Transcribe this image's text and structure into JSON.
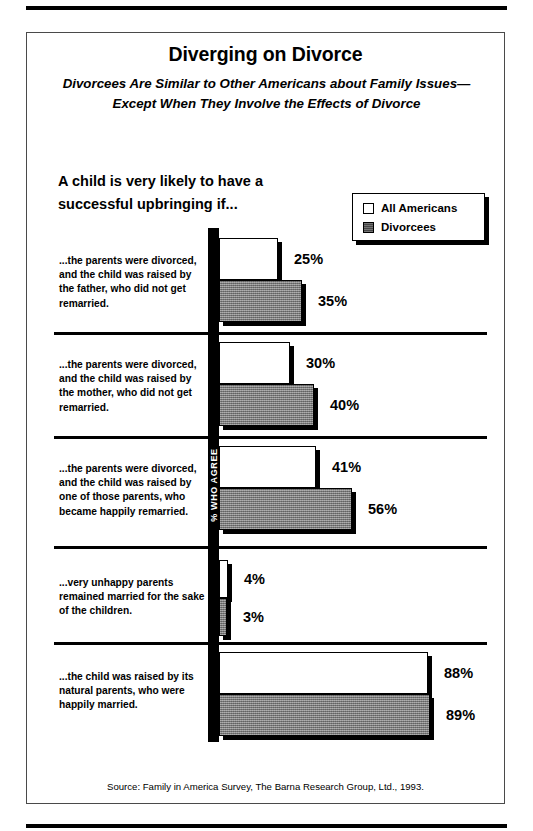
{
  "title": "Diverging on Divorce",
  "subtitle": "Divorcees Are Similar to Other Americans about Family Issues—Except When They Involve the Effects of Divorce",
  "question_header": "A child is very likely to have a successful upbringing if...",
  "axis_caption": "% WHO AGREE",
  "legend": {
    "items": [
      {
        "label": "All Americans",
        "swatch": "white-square-icon",
        "color": "#ffffff"
      },
      {
        "label": "Divorcees",
        "swatch": "gray-square-icon",
        "color": "#808080"
      }
    ]
  },
  "source": "Source: Family in America Survey, The Barna Research Group, Ltd., 1993.",
  "chart_data": {
    "type": "bar",
    "title": "Diverging on Divorce",
    "subtitle": "Divorcees Are Similar to Other Americans about Family Issues—Except When They Involve the Effects of Divorce",
    "xlabel": "% WHO AGREE",
    "ylabel": "",
    "orientation": "horizontal",
    "grid": false,
    "legend_position": "top-right",
    "xlim": [
      0,
      100
    ],
    "categories": [
      "...the parents were divorced, and the child was raised by the father, who did not get remarried.",
      "...the parents were divorced, and the child was raised by the mother, who did not get remarried.",
      "...the parents were divorced, and the child was raised by one of those parents, who became happily remarried.",
      "...very unhappy parents remained married for the sake of the children.",
      "...the child was raised by its natural parents, who were happily married."
    ],
    "series": [
      {
        "name": "All Americans",
        "color": "#ffffff",
        "values": [
          25,
          30,
          41,
          4,
          88
        ]
      },
      {
        "name": "Divorcees",
        "color": "#808080",
        "values": [
          35,
          40,
          56,
          3,
          89
        ]
      }
    ],
    "value_labels": [
      [
        "25%",
        "35%"
      ],
      [
        "30%",
        "40%"
      ],
      [
        "41%",
        "56%"
      ],
      [
        "4%",
        "3%"
      ],
      [
        "88%",
        "89%"
      ]
    ]
  },
  "rows": [
    {
      "label": "...the parents were divorced, and the child was raised by the father, who did not get remarried.",
      "all": {
        "value": 25,
        "text": "25%"
      },
      "div": {
        "value": 35,
        "text": "35%"
      }
    },
    {
      "label": "...the parents were divorced, and the child was raised by the mother, who did not get remarried.",
      "all": {
        "value": 30,
        "text": "30%"
      },
      "div": {
        "value": 40,
        "text": "40%"
      }
    },
    {
      "label": "...the parents were divorced, and the child was raised by one of those parents, who became happily remarried.",
      "all": {
        "value": 41,
        "text": "41%"
      },
      "div": {
        "value": 56,
        "text": "56%"
      }
    },
    {
      "label": "...very unhappy parents remained married for the sake of the children.",
      "all": {
        "value": 4,
        "text": "4%"
      },
      "div": {
        "value": 3,
        "text": "3%"
      }
    },
    {
      "label": "...the child was raised by its natural parents, who were happily married.",
      "all": {
        "value": 88,
        "text": "88%"
      },
      "div": {
        "value": 89,
        "text": "89%"
      }
    }
  ]
}
